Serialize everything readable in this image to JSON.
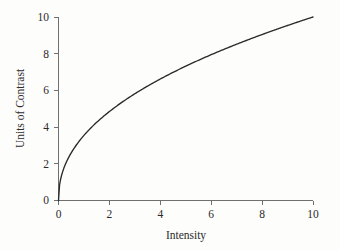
{
  "figure": {
    "width": 340,
    "height": 250,
    "background_color": "#fdfdfc",
    "axis_color": "#6f6f6f",
    "curve_color": "#2a2a2a",
    "text_color": "#2b2b2b"
  },
  "chart_data": {
    "type": "line",
    "title": "",
    "xlabel": "Intensity",
    "ylabel": "Units of Contrast",
    "xlim": [
      0,
      10
    ],
    "ylim": [
      0,
      10
    ],
    "xticks": [
      0,
      2,
      4,
      6,
      8,
      10
    ],
    "yticks": [
      0,
      2,
      4,
      6,
      8,
      10
    ],
    "xticklabels": [
      "0",
      "2",
      "4",
      "6",
      "8",
      "10"
    ],
    "yticklabels": [
      "0",
      "2",
      "4",
      "6",
      "8",
      "10"
    ],
    "grid": false,
    "legend": false,
    "legend_position": "none",
    "series": [
      {
        "name": "contrast response",
        "relation": "y = 10 * (x / 10)^0.45",
        "x": [
          0,
          0.1,
          0.2,
          0.3,
          0.5,
          0.75,
          1,
          1.5,
          2,
          2.5,
          3,
          3.5,
          4,
          4.5,
          5,
          5.5,
          6,
          6.5,
          7,
          7.5,
          8,
          8.5,
          9,
          9.5,
          10
        ],
        "y": [
          0,
          1.26,
          1.72,
          2.06,
          2.58,
          3.07,
          3.55,
          4.2,
          4.86,
          5.35,
          5.83,
          6.23,
          6.64,
          6.98,
          7.32,
          7.62,
          7.92,
          8.19,
          8.46,
          8.7,
          8.94,
          9.17,
          9.4,
          9.6,
          10
        ]
      }
    ]
  },
  "labels": {
    "x_axis_title": "Intensity",
    "y_axis_title": "Units of Contrast",
    "x_tick_0": "0",
    "x_tick_1": "2",
    "x_tick_2": "4",
    "x_tick_3": "6",
    "x_tick_4": "8",
    "x_tick_5": "10",
    "y_tick_0": "0",
    "y_tick_1": "2",
    "y_tick_2": "4",
    "y_tick_3": "6",
    "y_tick_4": "8",
    "y_tick_5": "10"
  }
}
